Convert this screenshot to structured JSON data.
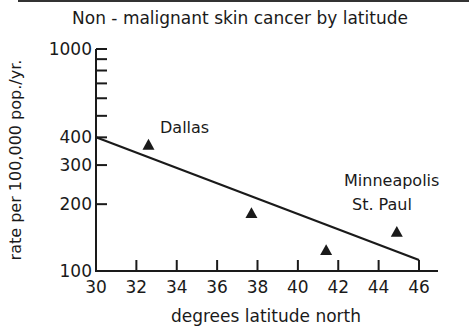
{
  "chart_data": {
    "type": "scatter",
    "xlabel": "degrees latitude north",
    "ylabel": "rate per 100,000 pop./yr.",
    "xlim": [
      30,
      46
    ],
    "ylim": [
      100,
      1000
    ],
    "yscale": "log",
    "grid": false,
    "x_ticks": [
      30,
      32,
      34,
      36,
      38,
      40,
      42,
      44,
      46
    ],
    "y_ticks_labeled": [
      100,
      200,
      300,
      400,
      1000
    ],
    "y_ticks_minor": [
      500,
      600,
      700,
      800,
      900
    ],
    "series": [
      {
        "name": "cities",
        "marker": "triangle",
        "points": [
          {
            "x": 32.6,
            "y": 370,
            "label": "Dallas"
          },
          {
            "x": 37.7,
            "y": 182,
            "label": ""
          },
          {
            "x": 41.4,
            "y": 124,
            "label": ""
          },
          {
            "x": 44.9,
            "y": 150,
            "label": "Minneapolis St. Paul"
          }
        ]
      }
    ],
    "trend_line": {
      "x": [
        30,
        46
      ],
      "y": [
        400,
        112
      ]
    },
    "annotations": [
      {
        "text": "Dallas",
        "x": 33.2,
        "y": 430
      },
      {
        "text": "Minneapolis",
        "x": 42.1,
        "y": 230
      },
      {
        "text": "St. Paul",
        "x": 42.4,
        "y": 195
      }
    ]
  },
  "labels": {
    "title": "Non - malignant skin cancer by latitude",
    "xlabel": "degrees latitude north",
    "ylabel": "rate per 100,000 pop./yr.",
    "dallas": "Dallas",
    "minneapolis": "Minneapolis",
    "stpaul": "St. Paul"
  },
  "colors": {
    "ink": "#1a1a1a",
    "background": "#ffffff"
  }
}
